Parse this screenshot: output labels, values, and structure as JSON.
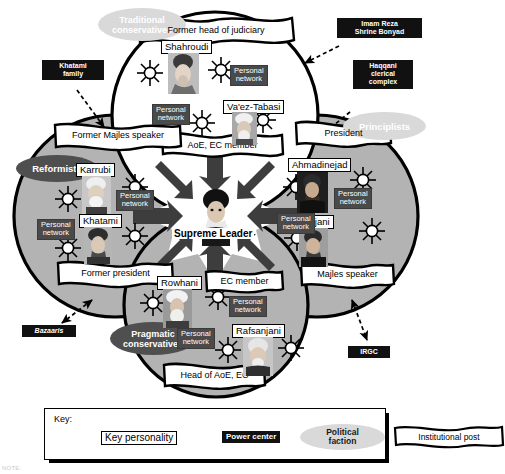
{
  "diagram": {
    "center": {
      "label": "Supreme Leader",
      "person": "Khamenei"
    },
    "factions": [
      {
        "id": "traditional-conservatives",
        "label": "Traditional\nconservatives",
        "line1": "Traditional",
        "line2": "conservatives",
        "tone": "light"
      },
      {
        "id": "principlists",
        "label": "Principlists",
        "line1": "Principlists",
        "line2": "",
        "tone": "light"
      },
      {
        "id": "reformists",
        "label": "Reformists",
        "line1": "Reformists",
        "line2": "",
        "tone": "dark"
      },
      {
        "id": "pragmatic-conservatives",
        "label": "Pragmatic\nconservatives",
        "line1": "Pragmatic",
        "line2": "conservatives",
        "tone": "dark"
      }
    ],
    "power_centers": [
      {
        "id": "khatami-family",
        "line1": "Khatami",
        "line2": "family",
        "line3": "",
        "italic": false
      },
      {
        "id": "imam-reza-bonyad",
        "line1": "Imam Reza",
        "line2": "Shrine Bonyad",
        "line3": "",
        "italic": false
      },
      {
        "id": "haqqani-complex",
        "line1": "Haqqani",
        "line2": "clerical",
        "line3": "complex",
        "italic": false
      },
      {
        "id": "bazaaris",
        "line1": "Bazaaris",
        "line2": "",
        "line3": "",
        "italic": true
      },
      {
        "id": "irgc",
        "line1": "IRGC",
        "line2": "",
        "line3": "",
        "italic": false
      }
    ],
    "personal_network_label": {
      "line1": "Personal",
      "line2": "network"
    },
    "people": [
      {
        "id": "shahroudi",
        "name": "Shahroudi",
        "post": "Former head of judiciary",
        "cluster": "traditional-conservatives"
      },
      {
        "id": "vaez-tabasi",
        "name": "Va'ez-Tabasi",
        "post": "AoE, EC member",
        "cluster": "traditional-conservatives"
      },
      {
        "id": "karrubi",
        "name": "Karrubi",
        "post": "Former Majles speaker",
        "cluster": "reformists"
      },
      {
        "id": "khatami",
        "name": "Khatami",
        "post": "Former president",
        "cluster": "reformists"
      },
      {
        "id": "ahmadinejad",
        "name": "Ahmadinejad",
        "post": "President",
        "cluster": "principlists"
      },
      {
        "id": "larijani",
        "name": "Larijani",
        "post": "Majles speaker",
        "cluster": "principlists"
      },
      {
        "id": "rowhani",
        "name": "Rowhani",
        "post": "EC member",
        "cluster": "pragmatic-conservatives"
      },
      {
        "id": "rafsanjani",
        "name": "Rafsanjani",
        "post": "Head of AoE, EC",
        "cluster": "pragmatic-conservatives"
      }
    ],
    "institutional_posts": [
      "Former head of judiciary",
      "AoE, EC member",
      "Former Majles speaker",
      "Former president",
      "President",
      "Majles speaker",
      "EC member",
      "Head of AoE, EC"
    ],
    "key": {
      "title": "Key:",
      "items": [
        {
          "id": "key-personality",
          "label": "Key personality"
        },
        {
          "id": "power-center",
          "label": "Power center"
        },
        {
          "id": "political-faction",
          "line1": "Political",
          "line2": "faction"
        },
        {
          "id": "institutional-post",
          "label": "Institutional post"
        }
      ]
    },
    "colors": {
      "power_center_bg": "#111111",
      "personal_network_bg": "#4a4a4a",
      "faction_light": "#d9d9d9",
      "faction_dark": "#4f4f4f",
      "circle_gray": "#b3b3b3",
      "circle_white": "#ffffff",
      "outline": "#000000"
    },
    "note": "NOTE:"
  }
}
